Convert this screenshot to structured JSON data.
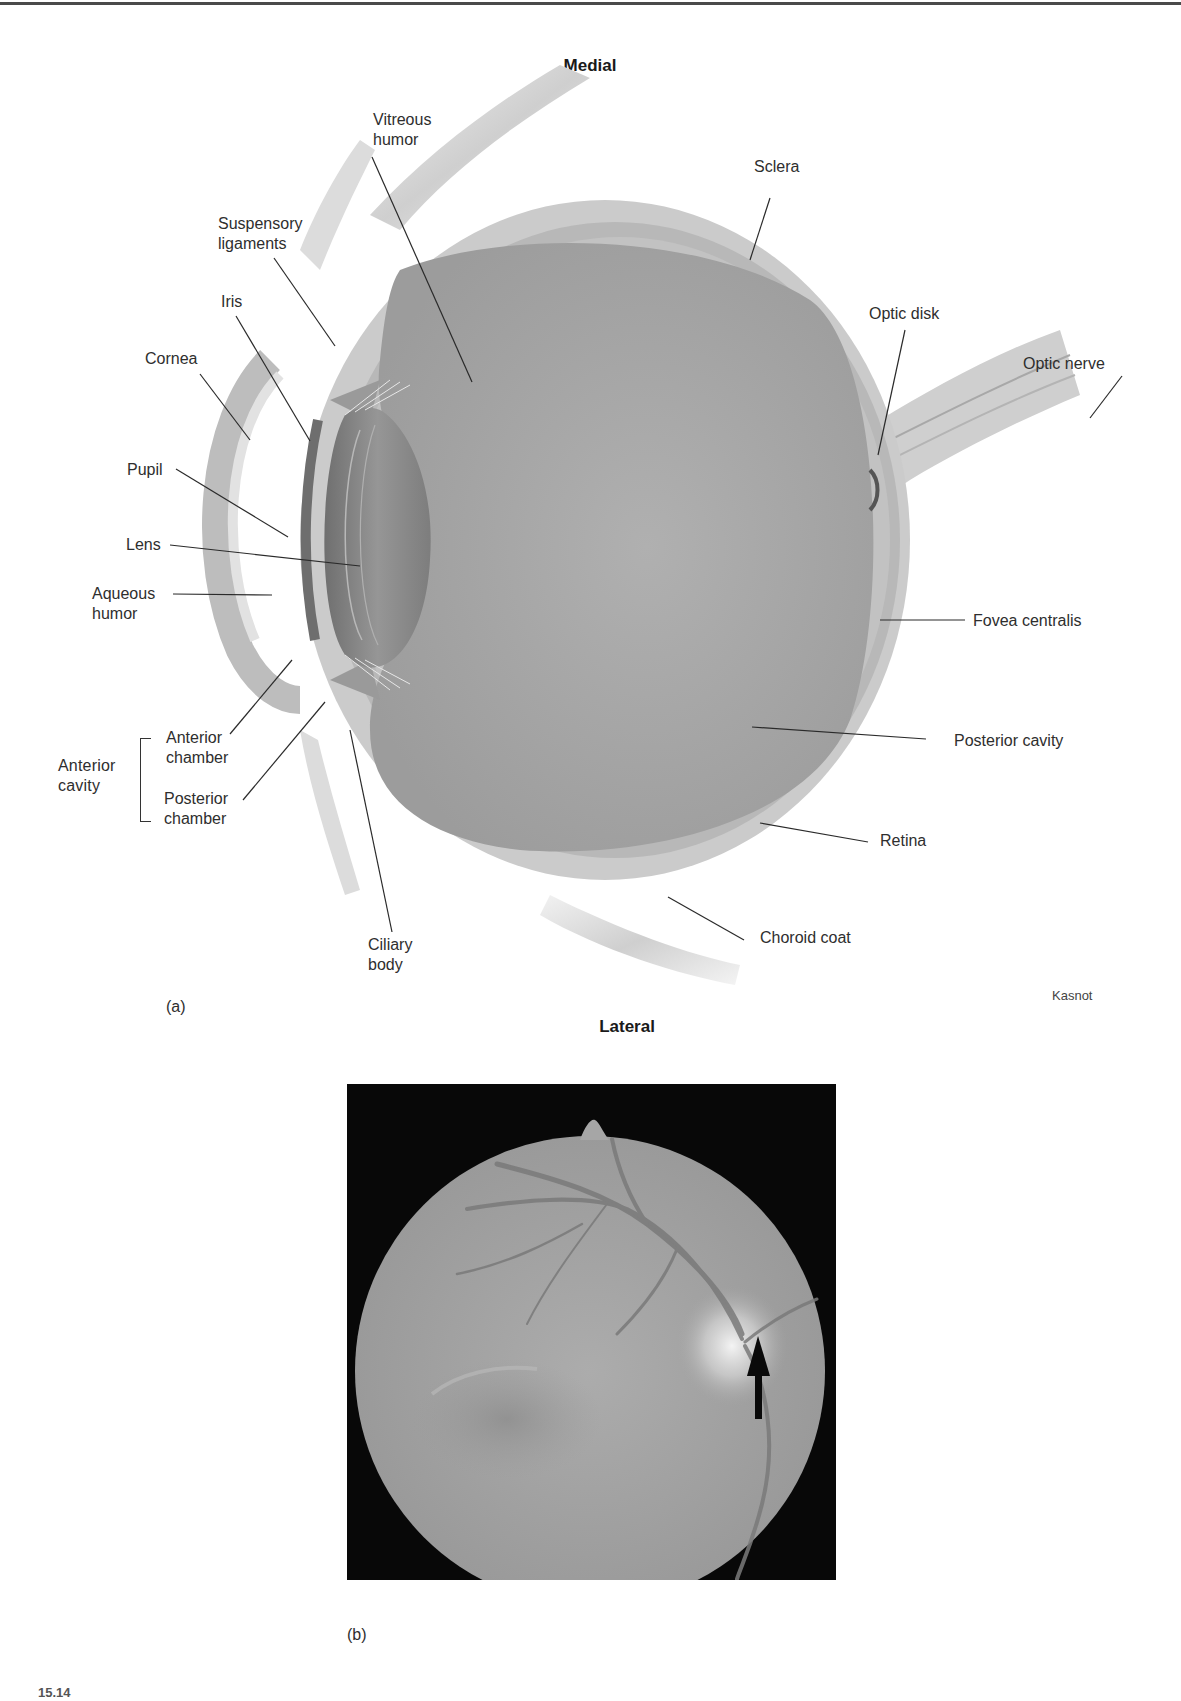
{
  "figure": {
    "orientation": {
      "top": "Medial",
      "bottom": "Lateral"
    },
    "panel_a": {
      "letter": "(a)",
      "credit": "Kasnot",
      "labels": {
        "vitreous_humor": "Vitreous\nhumor",
        "sclera": "Sclera",
        "suspensory_ligaments": "Suspensory\nligaments",
        "iris": "Iris",
        "optic_disk": "Optic disk",
        "cornea": "Cornea",
        "optic_nerve": "Optic nerve",
        "pupil": "Pupil",
        "lens": "Lens",
        "aqueous_humor": "Aqueous\nhumor",
        "fovea_centralis": "Fovea centralis",
        "anterior_chamber": "Anterior\nchamber",
        "anterior_cavity": "Anterior\ncavity",
        "posterior_chamber": "Posterior\nchamber",
        "posterior_cavity": "Posterior cavity",
        "retina": "Retina",
        "ciliary_body": "Ciliary\nbody",
        "choroid_coat": "Choroid coat"
      }
    },
    "panel_b": {
      "letter": "(b)",
      "description": "Fundus photograph with arrow indicating optic disk",
      "arrow_icon": "arrow-up-icon"
    },
    "caption_fragment": "15.14"
  },
  "colors": {
    "sclera": "#c9c9c9",
    "vitreous": "#a9a9a9",
    "lens": "#8a8a8a",
    "fundus_bg": "#080808",
    "fundus_disc": "#a8a8a8",
    "text": "#2e2e2e"
  }
}
